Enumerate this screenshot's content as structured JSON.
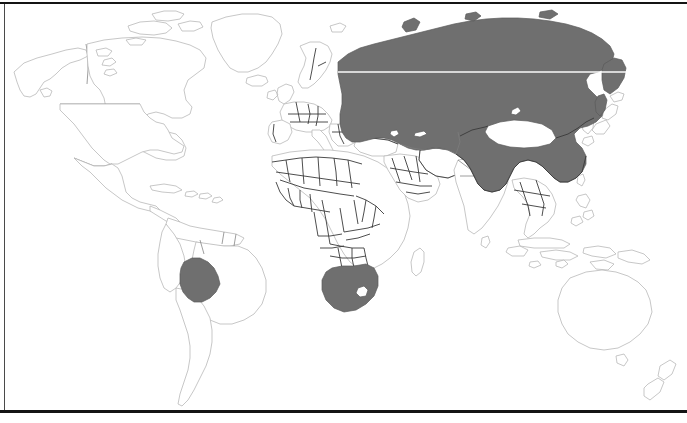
{
  "figure": {
    "kind": "world-map",
    "projection": "cylindrical",
    "background_color": "#ffffff",
    "land_fill_color": "#ffffff",
    "land_outline_color": "#b9b9b9",
    "border_color": "#3a3a3a",
    "highlight_color": "#6f6f6f",
    "frame_color": "#141414"
  },
  "legend": {
    "shaded_meaning": "highlighted country",
    "unshaded_meaning": "other country"
  },
  "highlighted_countries": [
    {
      "name": "Russia",
      "region": "Eurasia",
      "shaded": true
    },
    {
      "name": "Kazakhstan",
      "region": "Central Asia",
      "shaded": true
    },
    {
      "name": "China",
      "region": "East Asia",
      "shaded": true
    },
    {
      "name": "Bolivia",
      "region": "South America",
      "shaded": true
    },
    {
      "name": "South Africa",
      "region": "Africa",
      "shaded": true
    }
  ],
  "unshaded_enclaves": [
    {
      "name": "Mongolia",
      "enclosed_by": "Russia and China"
    },
    {
      "name": "Lesotho",
      "enclosed_by": "South Africa"
    }
  ],
  "notable_unshaded_regions": [
    "North America",
    "Greenland",
    "Europe",
    "Africa",
    "India",
    "Southeast Asia",
    "Japan",
    "Australia",
    "New Zealand"
  ],
  "artifacts": {
    "scanline": "light horizontal streak across northern Russia",
    "bottom_rule": "heavy black horizontal rule near page foot",
    "top_rule": "thin black horizontal rule at page head"
  }
}
